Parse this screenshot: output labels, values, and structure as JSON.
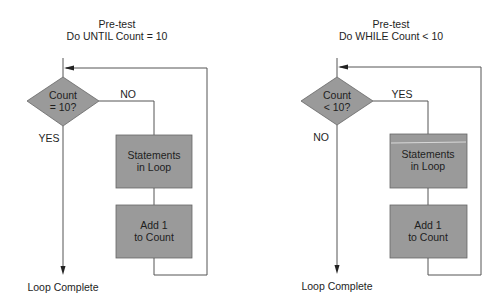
{
  "left": {
    "title_line1": "Pre-test",
    "title_line2": "Do UNTIL Count = 10",
    "decision_line1": "Count",
    "decision_line2": "= 10?",
    "branch_right_label": "NO",
    "branch_down_label": "YES",
    "box1_line1": "Statements",
    "box1_line2": "in Loop",
    "box2_line1": "Add 1",
    "box2_line2": "to Count",
    "end_label": "Loop Complete"
  },
  "right": {
    "title_line1": "Pre-test",
    "title_line2": "Do WHILE Count < 10",
    "decision_line1": "Count",
    "decision_line2": "< 10?",
    "branch_right_label": "YES",
    "branch_down_label": "NO",
    "box1_line1": "Statements",
    "box1_line2": "in Loop",
    "box2_line1": "Add 1",
    "box2_line2": "to Count",
    "end_label": "Loop Complete"
  },
  "colors": {
    "shape_fill": "#9a9a9a",
    "line": "#555555",
    "text": "#1e1e1e"
  }
}
